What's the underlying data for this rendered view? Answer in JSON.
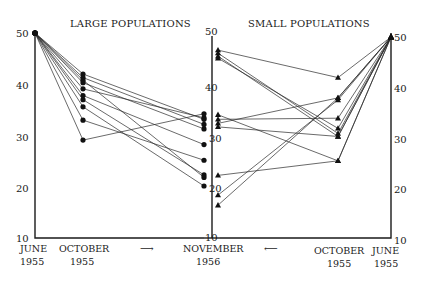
{
  "chart_data": {
    "type": "line",
    "panels": [
      {
        "title": "LARGE POPULATIONS",
        "marker": "circle",
        "x_categories": [
          "JUNE 1955",
          "OCTOBER 1955",
          "NOVEMBER 1956"
        ],
        "series": [
          {
            "values": [
              50,
              42.0,
              33.5
            ]
          },
          {
            "values": [
              50,
              41.3,
              32.5
            ]
          },
          {
            "values": [
              50,
              40.8,
              22.0
            ]
          },
          {
            "values": [
              50,
              40.3,
              31.6
            ]
          },
          {
            "values": [
              50,
              39.1,
              33.8
            ]
          },
          {
            "values": [
              50,
              37.8,
              28.5
            ]
          },
          {
            "values": [
              50,
              37.0,
              22.5
            ]
          },
          {
            "values": [
              50,
              35.6,
              20.3
            ]
          },
          {
            "values": [
              50,
              33.0,
              25.4
            ]
          },
          {
            "values": [
              50,
              29.1,
              34.6
            ]
          }
        ]
      },
      {
        "title": "SMALL POPULATIONS",
        "marker": "triangle",
        "x_categories": [
          "NOVEMBER 1956",
          "OCTOBER 1955",
          "JUNE 1955"
        ],
        "series": [
          {
            "values": [
              47.2,
              42.0,
              50
            ]
          },
          {
            "values": [
              46.6,
              31.0,
              50
            ]
          },
          {
            "values": [
              46.0,
              30.4,
              50
            ]
          },
          {
            "values": [
              45.6,
              32.0,
              50
            ]
          },
          {
            "values": [
              34.4,
              25.6,
              50
            ]
          },
          {
            "values": [
              33.5,
              34.0,
              50
            ]
          },
          {
            "values": [
              32.7,
              38.0,
              50
            ]
          },
          {
            "values": [
              32.0,
              30.4,
              50
            ]
          },
          {
            "values": [
              22.4,
              25.6,
              50
            ]
          },
          {
            "values": [
              18.5,
              37.6,
              50
            ]
          },
          {
            "values": [
              16.5,
              38.0,
              50
            ]
          }
        ]
      }
    ],
    "y_axis": {
      "ticks": [
        10,
        20,
        30,
        40,
        50
      ],
      "ylim": [
        10,
        50
      ]
    },
    "xlabel": "",
    "ylabel": "",
    "grid": false,
    "annotations": [
      "→ (left panel, time flows toward November 1956)",
      "← (right panel, time flows toward November 1956)"
    ]
  },
  "titles": {
    "left": "LARGE POPULATIONS",
    "right": "SMALL POPULATIONS"
  },
  "ticks": {
    "left": [
      "50",
      "40",
      "30",
      "20",
      "10"
    ],
    "middle": [
      "50",
      "40",
      "30",
      "20",
      "10"
    ],
    "right": [
      "50",
      "40",
      "30",
      "20",
      "10"
    ]
  },
  "xlabels": {
    "june_left": [
      "JUNE",
      "1955"
    ],
    "october_left": [
      "OCTOBER",
      "1955"
    ],
    "november": [
      "NOVEMBER",
      "1956"
    ],
    "october_right": [
      "OCTOBER",
      "1955"
    ],
    "june_right": [
      "JUNE",
      "1955"
    ],
    "arrow_right": "⟶",
    "arrow_left": "⟵"
  }
}
